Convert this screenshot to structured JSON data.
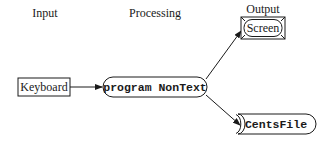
{
  "columns": {
    "input": "Input",
    "processing": "Processing",
    "output": "Output"
  },
  "nodes": {
    "keyboard": {
      "label": "Keyboard",
      "shape": "rectangle"
    },
    "program": {
      "label": "program NonText",
      "shape": "rounded-pill"
    },
    "screen": {
      "label": "Screen",
      "shape": "screen-display"
    },
    "centsfile": {
      "label": "CentsFile",
      "shape": "file-storage"
    }
  },
  "edges": [
    {
      "from": "keyboard",
      "to": "program"
    },
    {
      "from": "program",
      "to": "screen"
    },
    {
      "from": "program",
      "to": "centsfile"
    }
  ],
  "colors": {
    "line": "#1a1a1a",
    "background": "#ffffff"
  }
}
